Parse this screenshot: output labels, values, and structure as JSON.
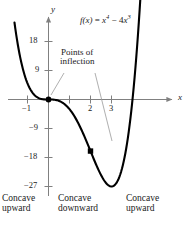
{
  "figure": {
    "equation_parts": {
      "fx": "f(x)",
      "equals": " = ",
      "term1_base": "x",
      "term1_exp": "4",
      "minus": " − 4",
      "term2_base": "x",
      "term2_exp": "3"
    },
    "equation_text": "f(x) = x4 − 4x3",
    "axis_labels": {
      "x": "x",
      "y": "y"
    },
    "y_ticks": [
      {
        "value": 18,
        "label": "18"
      },
      {
        "value": 9,
        "label": "9"
      },
      {
        "value": -9,
        "label": "−9"
      },
      {
        "value": -18,
        "label": "−18"
      },
      {
        "value": -27,
        "label": "−27"
      }
    ],
    "x_ticks": [
      {
        "value": -1,
        "label": "−1"
      },
      {
        "value": 1,
        "label": ""
      },
      {
        "value": 2,
        "label": "2"
      },
      {
        "value": 3,
        "label": "3"
      }
    ],
    "annotation": {
      "line1": "Points of",
      "line2": "inflection"
    },
    "concavity_labels": [
      {
        "line1": "Concave",
        "line2": "upward"
      },
      {
        "line1": "Concave",
        "line2": "downward"
      },
      {
        "line1": "Concave",
        "line2": "upward"
      }
    ],
    "colors": {
      "curve": "#000000",
      "axis": "#808080",
      "text": "#1a1a1a",
      "leader": "#999999",
      "point": "#000000"
    }
  },
  "chart_data": {
    "type": "line",
    "title": "",
    "subtitle": "",
    "xlabel": "x",
    "ylabel": "y",
    "function": "f(x) = x^4 - 4x^3",
    "xlim": [
      -1.6,
      4.6
    ],
    "ylim": [
      -32,
      24
    ],
    "grid": false,
    "legend": null,
    "x_tick_values": [
      -1,
      1,
      2,
      3
    ],
    "x_tick_labels": [
      "−1",
      "",
      "2",
      "3"
    ],
    "y_tick_values": [
      18,
      9,
      -9,
      -18,
      -27
    ],
    "y_tick_labels": [
      "18",
      "9",
      "−9",
      "−18",
      "−27"
    ],
    "series": [
      {
        "name": "f(x) = x^4 - 4x^3",
        "x": [
          -1.6,
          -1.4,
          -1.2,
          -1.0,
          -0.8,
          -0.6,
          -0.4,
          -0.2,
          0.0,
          0.2,
          0.4,
          0.6,
          0.8,
          1.0,
          1.2,
          1.4,
          1.6,
          1.8,
          2.0,
          2.2,
          2.4,
          2.6,
          2.8,
          3.0,
          3.2,
          3.4,
          3.6,
          3.8,
          4.0,
          4.2,
          4.4
        ],
        "y": [
          22.91,
          14.82,
          9.0,
          5.0,
          2.46,
          1.09,
          0.28,
          0.03,
          0.0,
          -0.03,
          -0.23,
          -0.73,
          -1.64,
          -3.0,
          -4.84,
          -7.06,
          -9.42,
          -11.66,
          -16.0,
          -19.18,
          -21.5,
          -22.97,
          -23.23,
          -27.0,
          -25.49,
          -22.18,
          -16.46,
          -7.8,
          0.0,
          14.0,
          34.07
        ],
        "annotations": [
          {
            "x": 0,
            "y": 0,
            "label": "Point of inflection",
            "marker": true
          },
          {
            "x": 2,
            "y": -16,
            "label": "Point of inflection",
            "marker": true
          }
        ]
      }
    ],
    "regions": [
      {
        "label": "Concave upward",
        "x_range": [
          -1.6,
          0
        ]
      },
      {
        "label": "Concave downward",
        "x_range": [
          0,
          2
        ]
      },
      {
        "label": "Concave upward",
        "x_range": [
          2,
          4.6
        ]
      }
    ]
  }
}
